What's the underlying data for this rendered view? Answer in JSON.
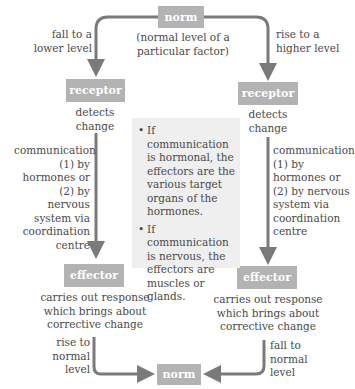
{
  "diagram": {
    "top_norm": {
      "label": "norm",
      "caption": "(normal level of a particular factor)"
    },
    "left": {
      "branch_label": "fall to a lower level",
      "receptor": {
        "label": "receptor",
        "caption": "detects change"
      },
      "communication": "communication (1) by hormones or (2) by nervous system via coordination centre",
      "effector": {
        "label": "effector",
        "caption": "carries out response which brings about corrective change"
      },
      "return_label": "rise to normal level"
    },
    "right": {
      "branch_label": "rise to a higher level",
      "receptor": {
        "label": "receptor",
        "caption": "detects change"
      },
      "communication": "communication (1) by hormones or (2) by nervous system via coordination centre",
      "effector": {
        "label": "effector",
        "caption": "carries out response which brings about corrective change"
      },
      "return_label": "fall to normal level"
    },
    "bottom_norm": {
      "label": "norm"
    },
    "info_box": {
      "items": [
        "If communication is hormonal, the effectors are the various target organs of the hormones.",
        "If communication is nervous, the effectors are muscles or glands."
      ]
    },
    "colors": {
      "box": "#b3b3b3",
      "arrow": "#7a7a7a",
      "info_bg": "#efefef",
      "text": "#4a4a4a"
    }
  }
}
